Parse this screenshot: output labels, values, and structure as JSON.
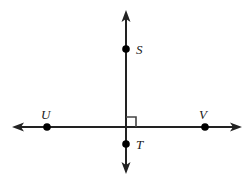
{
  "figure": {
    "colors": {
      "line": "#222222",
      "point": "#000000",
      "label": "#1a1a1a",
      "background": "#ffffff",
      "right_angle_marker": "#444444"
    },
    "points": [
      {
        "id": "S",
        "label": "S",
        "cx": 126,
        "cy": 49,
        "r": 3.8,
        "label_x": 136,
        "label_y": 43
      },
      {
        "id": "T",
        "label": "T",
        "cx": 126,
        "cy": 144,
        "r": 3.8,
        "label_x": 136,
        "label_y": 138
      },
      {
        "id": "U",
        "label": "U",
        "cx": 47,
        "cy": 127,
        "r": 3.8,
        "label_x": 41,
        "label_y": 108
      },
      {
        "id": "V",
        "label": "V",
        "cx": 205,
        "cy": 127,
        "r": 3.8,
        "label_x": 199,
        "label_y": 108
      }
    ],
    "lines": [
      {
        "id": "vertical-line-ST",
        "orientation": "vertical",
        "x1": 126,
        "y1": 16,
        "x2": 126,
        "y2": 168,
        "stroke_width": 2,
        "arrowheads": [
          "start",
          "end"
        ]
      },
      {
        "id": "horizontal-line-UV",
        "orientation": "horizontal",
        "x1": 18,
        "y1": 127,
        "x2": 236,
        "y2": 127,
        "stroke_width": 2,
        "arrowheads": [
          "start",
          "end"
        ]
      }
    ],
    "right_angle_marker": {
      "id": "right-angle-square",
      "quadrant": "upper-right",
      "x": 126,
      "y": 117,
      "size": 10,
      "stroke_width": 1.6
    },
    "arrow_tips": {
      "top": {
        "x": 126,
        "y": 12
      },
      "bottom": {
        "x": 126,
        "y": 172
      },
      "left": {
        "x": 14,
        "y": 127
      },
      "right": {
        "x": 240,
        "y": 127
      }
    }
  }
}
